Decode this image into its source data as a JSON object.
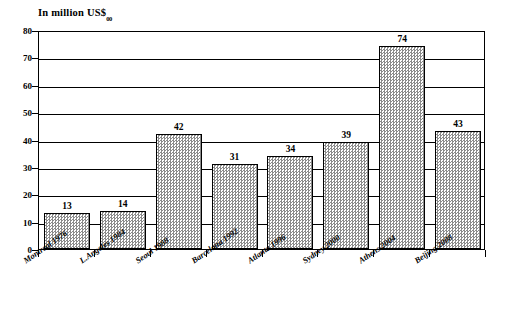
{
  "chart_data": {
    "type": "bar",
    "title": "In million US$",
    "title_subscript": "00",
    "xlabel": "",
    "ylabel": "",
    "categories": [
      "Montreal 1976",
      "L.Angeles 1984",
      "Seoul 1988",
      "Barcelona 1992",
      "Atlanta 1996",
      "Sydney 2000",
      "Athens 2004",
      "Beijing 2008"
    ],
    "values": [
      13,
      14,
      42,
      31,
      34,
      39,
      74,
      43
    ],
    "value_labels": [
      "13",
      "14",
      "42",
      "31",
      "34",
      "39",
      "74",
      "43"
    ],
    "ylim": [
      0,
      80
    ],
    "yticks": [
      0,
      10,
      20,
      30,
      40,
      50,
      60,
      70,
      80
    ],
    "ytick_labels": [
      "0",
      "10",
      "20",
      "30",
      "40",
      "50",
      "60",
      "70",
      "80"
    ],
    "grid": true,
    "grid_axis": "y",
    "legend": null,
    "bar_fill": "#8b8b8b",
    "bar_fill_style": "fine-checker-hatch",
    "bar_edge_color": "#000000",
    "axis_color": "#000000",
    "background": "#ffffff"
  }
}
